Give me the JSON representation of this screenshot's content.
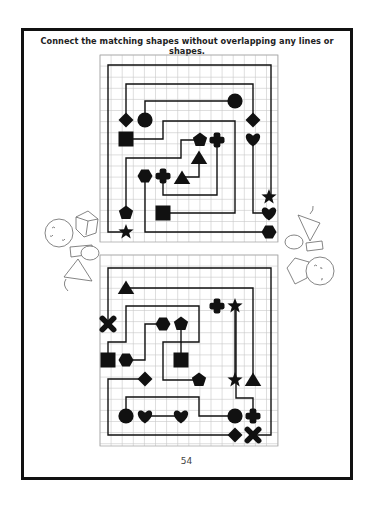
{
  "page": {
    "instruction": "Connect the matching shapes without overlapping any lines or shapes.",
    "page_number": "54"
  },
  "colors": {
    "ink": "#111111",
    "grid": "#c8c8c8",
    "frame": "#111111",
    "sketch": "#666666"
  },
  "puzzles": [
    {
      "name": "top-puzzle",
      "shapes": [
        {
          "type": "diamond",
          "pair": "a"
        },
        {
          "type": "circle",
          "pair": "b"
        },
        {
          "type": "circle",
          "pair": "b"
        },
        {
          "type": "diamond",
          "pair": "a"
        },
        {
          "type": "heart",
          "pair": "c"
        },
        {
          "type": "square",
          "pair": "d"
        },
        {
          "type": "pentagon",
          "pair": "e"
        },
        {
          "type": "cross",
          "pair": "f"
        },
        {
          "type": "triangle",
          "pair": "g"
        },
        {
          "type": "hexagon",
          "pair": "h"
        },
        {
          "type": "cross",
          "pair": "f"
        },
        {
          "type": "triangle",
          "pair": "g"
        },
        {
          "type": "star",
          "pair": "i"
        },
        {
          "type": "pentagon",
          "pair": "e"
        },
        {
          "type": "square",
          "pair": "d"
        },
        {
          "type": "heart",
          "pair": "c"
        },
        {
          "type": "star",
          "pair": "i"
        },
        {
          "type": "hexagon",
          "pair": "h"
        }
      ]
    },
    {
      "name": "bottom-puzzle",
      "shapes": [
        {
          "type": "triangle",
          "pair": "a"
        },
        {
          "type": "cross",
          "pair": "b"
        },
        {
          "type": "star",
          "pair": "c"
        },
        {
          "type": "x",
          "pair": "d"
        },
        {
          "type": "hexagon",
          "pair": "e"
        },
        {
          "type": "pentagon",
          "pair": "f"
        },
        {
          "type": "square",
          "pair": "g"
        },
        {
          "type": "hexagon",
          "pair": "e"
        },
        {
          "type": "square",
          "pair": "g"
        },
        {
          "type": "diamond",
          "pair": "h"
        },
        {
          "type": "pentagon",
          "pair": "f"
        },
        {
          "type": "star",
          "pair": "c"
        },
        {
          "type": "triangle",
          "pair": "a"
        },
        {
          "type": "circle",
          "pair": "i"
        },
        {
          "type": "heart",
          "pair": "j"
        },
        {
          "type": "heart",
          "pair": "j"
        },
        {
          "type": "circle",
          "pair": "i"
        },
        {
          "type": "cross",
          "pair": "b"
        },
        {
          "type": "diamond",
          "pair": "h"
        },
        {
          "type": "x",
          "pair": "d"
        }
      ]
    }
  ],
  "decorations": [
    {
      "name": "cartoon-figure-left",
      "kind": "sketch"
    },
    {
      "name": "cartoon-figure-right",
      "kind": "sketch"
    }
  ]
}
